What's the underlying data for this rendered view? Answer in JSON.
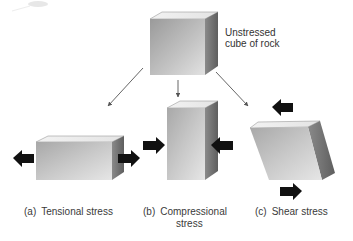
{
  "diagram": {
    "title_label": {
      "line1": "Unstressed",
      "line2": "cube of rock"
    },
    "captions": [
      {
        "tag": "(a)",
        "text": "Tensional stress"
      },
      {
        "tag": "(b)",
        "text": "Compressional",
        "text_line2": "stress"
      },
      {
        "tag": "(c)",
        "text": "Shear stress"
      }
    ],
    "colors": {
      "background": "#ffffff",
      "cube_front_light": "#d8d8d8",
      "cube_front_dark": "#8e8e8e",
      "cube_top": "#f4f4f4",
      "cube_side": "#6e6e6e",
      "force_arrow": "#111111",
      "connector_arrow": "#555555",
      "text": "#333333"
    },
    "nodes": [
      {
        "id": "unstressed-cube",
        "shape": "cube"
      },
      {
        "id": "tensional-block",
        "shape": "elongated-box",
        "forces": [
          "left-outward",
          "right-outward"
        ]
      },
      {
        "id": "compressional-block",
        "shape": "tall-box",
        "forces": [
          "left-inward",
          "right-inward"
        ]
      },
      {
        "id": "shear-block",
        "shape": "parallelepiped",
        "forces": [
          "top-left",
          "bottom-right"
        ]
      }
    ],
    "edges": [
      {
        "from": "unstressed-cube",
        "to": "tensional-block"
      },
      {
        "from": "unstressed-cube",
        "to": "compressional-block"
      },
      {
        "from": "unstressed-cube",
        "to": "shear-block"
      }
    ]
  }
}
